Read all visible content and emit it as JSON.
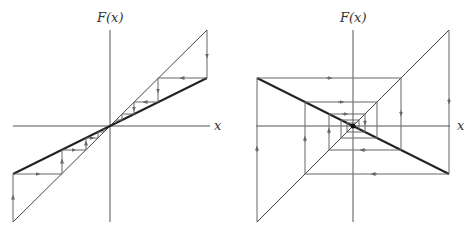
{
  "panels": [
    {
      "id": "left",
      "ylabel": "F(x)",
      "xlabel": "x",
      "description": "Monotone convergence to fixed point (0 < slope < 1)",
      "slope": 0.5
    },
    {
      "id": "right",
      "ylabel": "F(x)",
      "xlabel": "x",
      "description": "Oscillating convergence to fixed point (-1 < slope < 0)",
      "slope": -0.5
    }
  ],
  "colors": {
    "axis": "#555555",
    "diagonal": "#444444",
    "function": "#222222",
    "cobweb": "#666666"
  }
}
